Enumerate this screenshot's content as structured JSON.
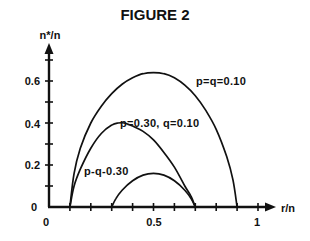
{
  "chart_data": {
    "type": "line",
    "title": "FIGURE 2",
    "xlabel": "r/n",
    "ylabel": "n*/n",
    "xlim": [
      0,
      1.05
    ],
    "ylim": [
      0,
      0.7
    ],
    "grid": false,
    "legend": "inline annotations",
    "x_ticks": [
      0,
      0.1,
      0.2,
      0.3,
      0.4,
      0.5,
      0.6,
      0.7,
      0.8,
      0.9,
      1.0
    ],
    "x_tick_labels": [
      {
        "value": 0,
        "label": "0"
      },
      {
        "value": 0.5,
        "label": "0.5"
      },
      {
        "value": 1,
        "label": "1"
      }
    ],
    "y_ticks": [
      0.1,
      0.2,
      0.3,
      0.4,
      0.5,
      0.6,
      0.7
    ],
    "y_tick_labels": [
      {
        "value": 0,
        "label": "0"
      },
      {
        "value": 0.2,
        "label": "0.2"
      },
      {
        "value": 0.4,
        "label": "0.4"
      },
      {
        "value": 0.6,
        "label": "0.6"
      }
    ],
    "series": [
      {
        "name": "p=q=0.10",
        "x": [
          0.1,
          0.12,
          0.15,
          0.2,
          0.25,
          0.3,
          0.35,
          0.4,
          0.45,
          0.5,
          0.55,
          0.6,
          0.65,
          0.7,
          0.75,
          0.8,
          0.85,
          0.88,
          0.9
        ],
        "y": [
          0.0,
          0.16,
          0.28,
          0.4,
          0.48,
          0.54,
          0.585,
          0.615,
          0.635,
          0.64,
          0.635,
          0.615,
          0.58,
          0.53,
          0.46,
          0.37,
          0.24,
          0.13,
          0.0
        ]
      },
      {
        "name": "p=0.30, q=0.10",
        "x": [
          0.1,
          0.12,
          0.15,
          0.2,
          0.25,
          0.3,
          0.33,
          0.36,
          0.4,
          0.45,
          0.5,
          0.55,
          0.6,
          0.65,
          0.68,
          0.7
        ],
        "y": [
          0.0,
          0.1,
          0.18,
          0.28,
          0.35,
          0.39,
          0.4,
          0.4,
          0.385,
          0.36,
          0.32,
          0.26,
          0.19,
          0.1,
          0.05,
          0.0
        ]
      },
      {
        "name": "p=q=0.30",
        "x": [
          0.3,
          0.32,
          0.35,
          0.4,
          0.45,
          0.5,
          0.55,
          0.6,
          0.65,
          0.68,
          0.7
        ],
        "y": [
          0.0,
          0.04,
          0.08,
          0.125,
          0.152,
          0.16,
          0.152,
          0.125,
          0.08,
          0.04,
          0.0
        ]
      }
    ],
    "annotations": [
      {
        "text": "p=q=0.10",
        "x": 0.7,
        "y": 0.6
      },
      {
        "text": "p=0.30, q=0.10",
        "x": 0.29,
        "y": 0.4
      },
      {
        "text": "p-q-0.30",
        "x": 0.16,
        "y": 0.11
      }
    ]
  },
  "labels": {
    "title": "FIGURE 2",
    "ylabel": "n*/n",
    "xlabel": "r/n",
    "x0": "0",
    "x05": "0.5",
    "x1": "1",
    "y0": "0",
    "y02": "0.2",
    "y04": "0.4",
    "y06": "0.6",
    "ann1": "p=q=0.10",
    "ann2": "p=0.30, q=0.10",
    "ann3": "p-q-0.30"
  }
}
